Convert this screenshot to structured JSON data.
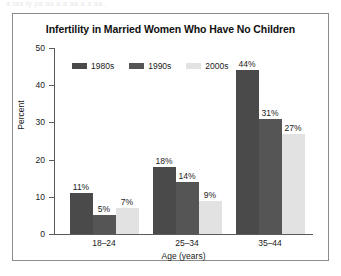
{
  "scan_artifact": {
    "ghost_text": "a taa ty pa aa a  a aa   a  a  aa     ,"
  },
  "figure": {
    "title": "Infertility in Married Women Who Have No Children"
  },
  "legend": {
    "items": [
      {
        "label": "1980s",
        "color": "#4a4a4a"
      },
      {
        "label": "1990s",
        "color": "#555555"
      },
      {
        "label": "2000s",
        "color": "#e2e2e2"
      }
    ]
  },
  "chart_data": {
    "type": "bar",
    "title": "Infertility in Married Women Who Have No Children",
    "xlabel": "Age (years)",
    "ylabel": "Percent",
    "ylim": [
      0,
      50
    ],
    "yticks": [
      0,
      10,
      20,
      30,
      40,
      50
    ],
    "ytick_labels": [
      "0",
      "10",
      "20",
      "30",
      "40",
      "50"
    ],
    "grid": false,
    "legend_position": "top-left-inside",
    "categories": [
      "18–24",
      "25–34",
      "35–44"
    ],
    "series": [
      {
        "name": "1980s",
        "color": "#4a4a4a",
        "values": [
          11,
          18,
          44
        ],
        "labels": [
          "11%",
          "18%",
          "44%"
        ]
      },
      {
        "name": "1990s",
        "color": "#555555",
        "values": [
          5,
          14,
          31
        ],
        "labels": [
          "5%",
          "14%",
          "31%"
        ]
      },
      {
        "name": "2000s",
        "color": "#e2e2e2",
        "values": [
          7,
          9,
          27
        ],
        "labels": [
          "7%",
          "9%",
          "27%"
        ]
      }
    ]
  }
}
